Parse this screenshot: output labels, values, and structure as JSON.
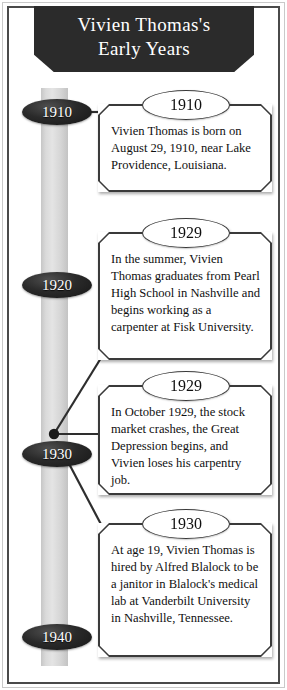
{
  "banner": {
    "title": "Vivien Thomas's\nEarly Years"
  },
  "timeline": {
    "decades": [
      {
        "label": "1910",
        "top": 99
      },
      {
        "label": "1920",
        "top": 272
      },
      {
        "label": "1930",
        "top": 441
      },
      {
        "label": "1940",
        "top": 624
      }
    ]
  },
  "events": [
    {
      "year": "1910",
      "text": "Vivien Thomas is born on August 29, 1910, near Lake Providence, Louisiana.",
      "left": 98,
      "top": 104,
      "width": 174,
      "height": 88
    },
    {
      "year": "1929",
      "text": "In the summer, Vivien Thomas graduates from Pearl High School in Nashville and begins working as a carpenter at Fisk University.",
      "left": 98,
      "top": 232,
      "width": 174,
      "height": 128
    },
    {
      "year": "1929",
      "text": "In October 1929, the stock market crashes, the Great Depression begins, and Vivien loses his carpentry job.",
      "left": 98,
      "top": 385,
      "width": 174,
      "height": 110
    },
    {
      "year": "1930",
      "text": "At age 19, Vivien Thomas is hired by Alfred Blalock to be a janitor in Blalock's medical lab at Vanderbilt University in Nashville, Tennessee.",
      "left": 98,
      "top": 523,
      "width": 174,
      "height": 134
    }
  ],
  "colors": {
    "banner_background": "#2b2b2b",
    "banner_text": "#ffffff",
    "decade_marker": "#1a1a1a",
    "timeline_bar": "#d8d8d8",
    "box_border": "#3a3a3a",
    "body_text": "#101010",
    "frame_border": "#4a4a4a"
  }
}
